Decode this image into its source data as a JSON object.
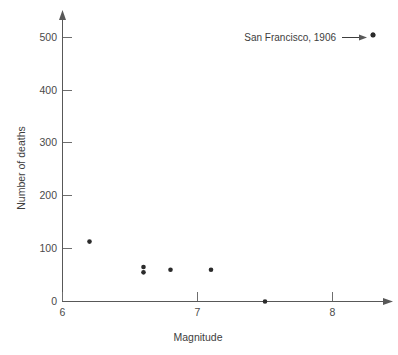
{
  "chart_data": {
    "type": "scatter",
    "title": "",
    "xlabel": "Magnitude",
    "ylabel": "Number of deaths",
    "xlim": [
      6,
      8.45
    ],
    "ylim": [
      0,
      530
    ],
    "grid": false,
    "legend_position": "none",
    "x_ticks": [
      6,
      7,
      8
    ],
    "x_tick_labels": [
      "6",
      "7",
      "8"
    ],
    "y_ticks": [
      0,
      100,
      200,
      300,
      400,
      500
    ],
    "y_tick_labels": [
      "0",
      "100",
      "200",
      "300",
      "400",
      "500"
    ],
    "points": [
      {
        "x": 6.2,
        "y": 113
      },
      {
        "x": 6.6,
        "y": 65
      },
      {
        "x": 6.6,
        "y": 55
      },
      {
        "x": 6.8,
        "y": 60
      },
      {
        "x": 7.1,
        "y": 60
      },
      {
        "x": 7.5,
        "y": 0
      },
      {
        "x": 8.3,
        "y": 503
      }
    ],
    "annotations": [
      {
        "label": "San Francisco, 1906",
        "target_x": 8.3,
        "target_y": 503
      }
    ]
  },
  "axes": {
    "x_label": "Magnitude",
    "y_label": "Number of deaths"
  },
  "ticks": {
    "x": [
      "6",
      "7",
      "8"
    ],
    "y": [
      "0",
      "100",
      "200",
      "300",
      "400",
      "500"
    ]
  },
  "annotation": {
    "label": "San Francisco, 1906"
  },
  "colors": {
    "background": "#ffffff",
    "axis": "#585858",
    "point": "#2b2b2b",
    "text": "#3d3d3d"
  }
}
